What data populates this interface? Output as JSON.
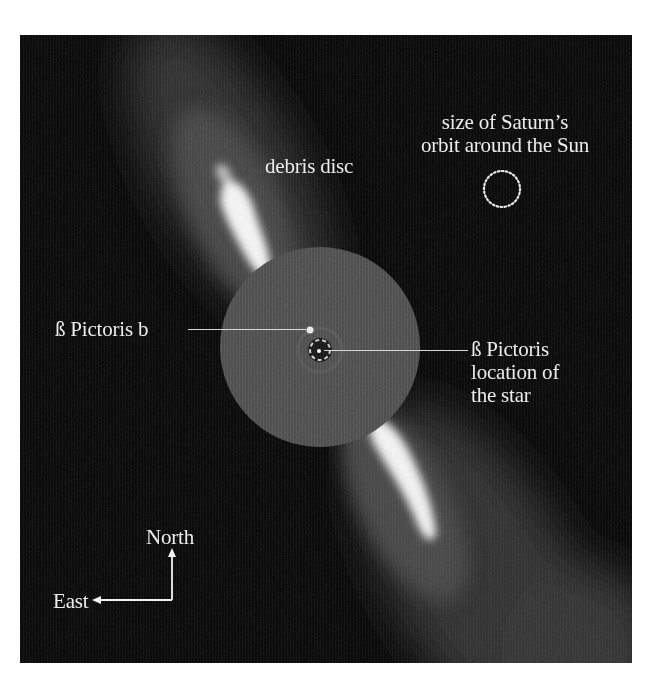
{
  "figure": {
    "colors": {
      "background": "#050505",
      "mask_grey": "#4a4a4a",
      "disc_core": "#f4f4f4",
      "disc_halo": "#3c3c3c",
      "label_text": "#ececec",
      "page": "#ffffff"
    }
  },
  "labels": {
    "debris_disc": "debris disc",
    "saturn_orbit_line1": "size of Saturn’s",
    "saturn_orbit_line2": "orbit around the Sun",
    "planet": "ß Pictoris b",
    "star_line1": "ß Pictoris",
    "star_line2": "location of",
    "star_line3": "the star",
    "compass_north": "North",
    "compass_east": "East"
  },
  "markers": {
    "saturn_orbit_circle": "dotted-circle",
    "planet_marker": "bright-dot",
    "star_marker": "masked-center-ring",
    "compass": "north-east-arrows"
  }
}
